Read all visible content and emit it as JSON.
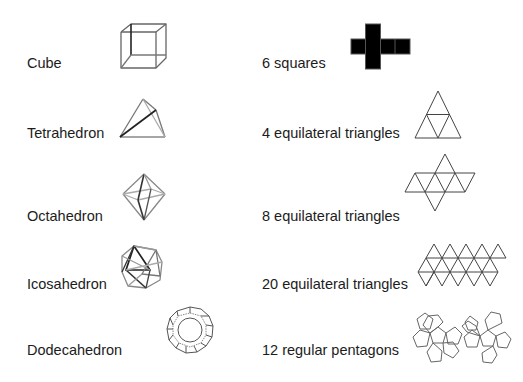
{
  "rows": [
    {
      "solid": "Cube",
      "faces": "6 squares"
    },
    {
      "solid": "Tetrahedron",
      "faces": "4 equilateral triangles"
    },
    {
      "solid": "Octahedron",
      "faces": "8 equilateral triangles"
    },
    {
      "solid": "Icosahedron",
      "faces": "20 equilateral triangles"
    },
    {
      "solid": "Dodecahedron",
      "faces": "12 regular pentagons"
    }
  ],
  "colors": {
    "text": "#1c1c1c",
    "wire_dark": "#333333",
    "wire_light": "#8a8a8a",
    "net_line": "#555555"
  },
  "icons": {
    "cube": "cube-wireframe-icon",
    "tetrahedron": "tetrahedron-wireframe-icon",
    "octahedron": "octahedron-wireframe-icon",
    "icosahedron": "icosahedron-wireframe-icon",
    "dodecahedron": "dodecahedron-wireframe-icon",
    "cube_net": "cube-net-icon",
    "tetrahedron_net": "tetrahedron-net-icon",
    "octahedron_net": "octahedron-net-icon",
    "icosahedron_net": "icosahedron-net-icon",
    "dodecahedron_net": "dodecahedron-net-icon"
  }
}
